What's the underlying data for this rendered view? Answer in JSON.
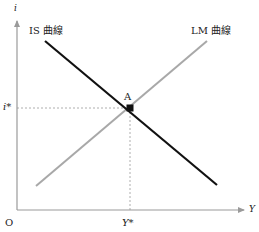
{
  "diagram": {
    "type": "IS-LM",
    "axes": {
      "y_label": "i",
      "x_label": "Y",
      "origin_label": "O",
      "axis_color": "#9a9a9a"
    },
    "curves": [
      {
        "name": "IS 曲線",
        "color": "#111111",
        "slope": "downward"
      },
      {
        "name": "LM 曲線",
        "color": "#a8a8a8",
        "slope": "upward"
      }
    ],
    "equilibrium": {
      "point_label": "A",
      "i_label": "i*",
      "y_label": "Y*",
      "guide_color": "#9a9a9a"
    }
  }
}
